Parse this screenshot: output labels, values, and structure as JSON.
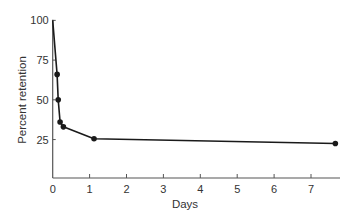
{
  "chart_data": {
    "type": "line",
    "title": "",
    "xlabel": "Days",
    "ylabel": "Percent retention",
    "xlim": [
      0,
      7.8
    ],
    "ylim": [
      0,
      100
    ],
    "xticks": [
      0,
      1,
      2,
      3,
      4,
      5,
      6,
      7
    ],
    "yticks": [
      25,
      50,
      75,
      100
    ],
    "grid": false,
    "legend": null,
    "series": [
      {
        "name": "Retention",
        "x": [
          0,
          0.12,
          0.15,
          0.2,
          0.29,
          1.12,
          7.66
        ],
        "y": [
          100,
          66,
          50,
          36,
          33,
          25.5,
          22.5
        ],
        "markers": [
          false,
          true,
          true,
          true,
          true,
          true,
          true
        ]
      }
    ],
    "colors": {
      "line": "#1a1a1a",
      "axis": "#555555",
      "text": "#333333"
    }
  }
}
